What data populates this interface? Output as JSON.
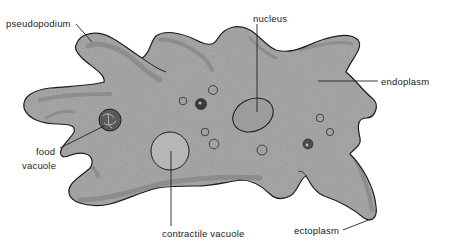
{
  "diagram": {
    "colors": {
      "cytoplasm": "#a9a9a9",
      "ectoplasm_band": "#8e8e8e",
      "outline": "#1e1e1e",
      "background": "#ffffff",
      "label": "#222222"
    },
    "labels": {
      "pseudopodium": "pseudopodium",
      "nucleus": "nucleus",
      "endoplasm": "endoplasm",
      "food_vacuole_line1": "food",
      "food_vacuole_line2": "vacuole",
      "contractile_vacuole": "contractile vacuole",
      "ectoplasm": "ectoplasm"
    },
    "structures": [
      {
        "name": "pseudopodium",
        "label_pos": [
          6,
          25
        ]
      },
      {
        "name": "nucleus",
        "label_pos": [
          252,
          20
        ]
      },
      {
        "name": "endoplasm",
        "label_pos": [
          380,
          84
        ]
      },
      {
        "name": "food vacuole",
        "label_pos": [
          32,
          152
        ]
      },
      {
        "name": "contractile vacuole",
        "label_pos": [
          162,
          237
        ]
      },
      {
        "name": "ectoplasm",
        "label_pos": [
          294,
          233
        ]
      }
    ]
  }
}
